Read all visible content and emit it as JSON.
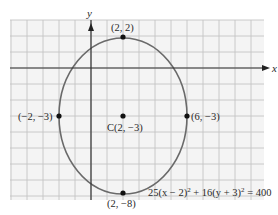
{
  "chart_data": {
    "type": "scatter",
    "title": "",
    "xlabel": "x",
    "ylabel": "y",
    "xlim": [
      -5,
      11
    ],
    "ylim": [
      -8.3,
      3
    ],
    "grid": true,
    "shape": "ellipse",
    "equation": "25(x − 2)² + 16(y + 3)² = 400",
    "center": {
      "label": "C(2, −3)",
      "x": 2,
      "y": -3
    },
    "semi_axis_x": 4,
    "semi_axis_y": 5,
    "points": [
      {
        "label": "(2, 2)",
        "x": 2,
        "y": 2
      },
      {
        "label": "(−2, −3)",
        "x": -2,
        "y": -3
      },
      {
        "label": "C(2, −3)",
        "x": 2,
        "y": -3
      },
      {
        "label": "(6, −3)",
        "x": 6,
        "y": -3
      },
      {
        "label": "(2, −8)",
        "x": 2,
        "y": -8
      }
    ]
  },
  "labels": {
    "x_axis": "x",
    "y_axis": "y",
    "top": "(2, 2)",
    "left": "(−2, −3)",
    "center": "C(2, −3)",
    "right": "(6, −3)",
    "bottom": "(2, −8)",
    "equation_main": "25(x − 2)",
    "equation_mid": " + 16(y + 3)",
    "equation_end": " = 400",
    "sup": "2"
  },
  "colors": {
    "grid": "#c4c4c4",
    "grid_bg": "#f4f4f4",
    "axis": "#333333",
    "ellipse": "#6a6a6a",
    "point": "#111111"
  }
}
